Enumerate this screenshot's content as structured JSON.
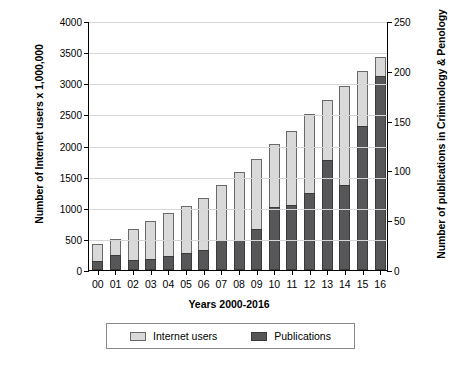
{
  "chart_data": {
    "type": "bar",
    "stacked": true,
    "title": "",
    "xlabel": "Years 2000-2016",
    "ylabel": "Number of Internet users x 1,000,000",
    "ylabel_secondary": "Number of publications in Criminology & Penology",
    "categories": [
      "00",
      "01",
      "02",
      "03",
      "04",
      "05",
      "06",
      "07",
      "08",
      "09",
      "10",
      "11",
      "12",
      "13",
      "14",
      "15",
      "16"
    ],
    "series": [
      {
        "name": "Internet users",
        "axis": "left",
        "color": "#d9d9d9",
        "values": [
          415,
          495,
          665,
          780,
          915,
          1025,
          1160,
          1370,
          1570,
          1780,
          2030,
          2230,
          2500,
          2730,
          2960,
          3190,
          3420
        ]
      },
      {
        "name": "Publications",
        "axis": "right",
        "color": "#575759",
        "values": [
          9,
          15,
          10,
          11,
          14,
          17,
          20,
          30,
          30,
          41,
          63,
          65,
          77,
          110,
          85,
          145,
          195
        ]
      }
    ],
    "ylim": [
      0,
      4000
    ],
    "yticks": [
      0,
      500,
      1000,
      1500,
      2000,
      2500,
      3000,
      3500,
      4000
    ],
    "ylim_secondary": [
      0,
      250
    ],
    "yticks_secondary": [
      0,
      50,
      100,
      150,
      200,
      250
    ],
    "grid": true,
    "legend_position": "bottom"
  },
  "legend": {
    "items": [
      {
        "label": "Internet users",
        "color": "#d9d9d9"
      },
      {
        "label": "Publications",
        "color": "#575759"
      }
    ]
  }
}
